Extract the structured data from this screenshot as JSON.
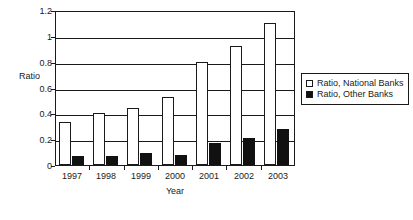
{
  "chart_data": {
    "type": "bar",
    "title": "",
    "xlabel": "Year",
    "ylabel": "Ratio",
    "categories": [
      "1997",
      "1998",
      "1999",
      "2000",
      "2001",
      "2002",
      "2003"
    ],
    "series": [
      {
        "name": "Ratio, National Banks",
        "style": "open-white-bar",
        "color": "#ffffff",
        "values": [
          0.33,
          0.4,
          0.44,
          0.53,
          0.8,
          0.92,
          1.1
        ]
      },
      {
        "name": "Ratio, Other Banks",
        "style": "filled-black-bar",
        "color": "#111111",
        "values": [
          0.07,
          0.07,
          0.09,
          0.08,
          0.17,
          0.21,
          0.275
        ]
      }
    ],
    "ylim": [
      0,
      1.2
    ],
    "ytick_labels": [
      "0",
      "0.2",
      "0.4",
      "0.6",
      "0.8",
      "1",
      "1.2"
    ],
    "ytick_values": [
      0,
      0.2,
      0.4,
      0.6,
      0.8,
      1,
      1.2
    ],
    "grid": true,
    "grid_axis": "y",
    "legend_position": "right",
    "frame": true
  },
  "legend": {
    "entries": [
      {
        "label": "Ratio, National Banks",
        "swatch": "open"
      },
      {
        "label": "Ratio, Other Banks",
        "swatch": "filled"
      }
    ]
  }
}
